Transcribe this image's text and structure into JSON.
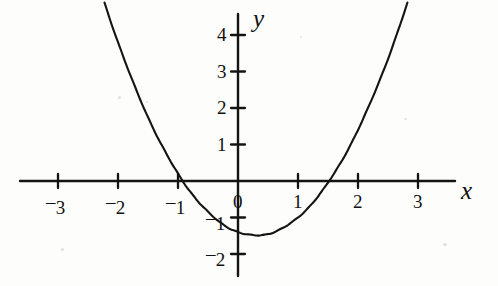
{
  "figure": {
    "background_color": "#fdfdfb",
    "ink_color": "#141414",
    "width": 498,
    "height": 286
  },
  "labels": {
    "x_axis": "x",
    "y_axis": "y"
  },
  "chart_data": {
    "type": "line",
    "title": "",
    "subtitle": "",
    "xlabel": "x",
    "ylabel": "y",
    "xlim": [
      -3.6,
      4.0
    ],
    "ylim": [
      -2.4,
      4.6
    ],
    "grid": false,
    "legend": false,
    "legend_position": "none",
    "x_ticks": [
      -3,
      -2,
      -1,
      0,
      1,
      2,
      3
    ],
    "x_tick_labels": [
      "-3",
      "-2",
      "-1",
      "0",
      "1",
      "2",
      "3"
    ],
    "y_ticks": [
      -2,
      -1,
      1,
      2,
      3,
      4
    ],
    "y_tick_labels": [
      "-2",
      "-1",
      "1",
      "2",
      "3",
      "4"
    ],
    "series": [
      {
        "name": "parabola",
        "equation": "y = x^2 - 0.6x - 1.4",
        "vertex": [
          0.3,
          -1.49
        ],
        "roots": [
          -1.28,
          1.88
        ],
        "y_intercept": -1.4,
        "x": [
          -2.7,
          -2.5,
          -2.25,
          -2.0,
          -1.75,
          -1.5,
          -1.28,
          -1.0,
          -0.75,
          -0.5,
          -0.25,
          0.0,
          0.3,
          0.5,
          0.75,
          1.0,
          1.25,
          1.5,
          1.88,
          2.0,
          2.25,
          2.5,
          2.75,
          3.0,
          3.25
        ],
        "y": [
          7.51,
          6.35,
          5.11,
          4.0,
          2.71,
          1.75,
          1.0,
          0.2,
          -0.39,
          -0.85,
          -1.19,
          -1.4,
          -1.49,
          -1.45,
          -1.29,
          -1.0,
          -0.59,
          -0.05,
          0.8,
          1.4,
          2.32,
          3.35,
          4.51,
          5.8,
          7.21
        ],
        "color": "#141414",
        "line_width": 2.1
      }
    ]
  },
  "geometry": {
    "origin_px": [
      238,
      181
    ],
    "x_unit_px": 60,
    "y_unit_px": 36.5,
    "x_axis_span_px": [
      20,
      455
    ],
    "y_axis_span_px": [
      14,
      276
    ],
    "tick_half_len_px": 7
  }
}
